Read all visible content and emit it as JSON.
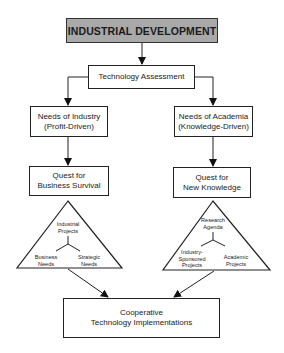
{
  "diagram": {
    "title": "INDUSTRIAL DEVELOPMENT",
    "assessment": "Technology Assessment",
    "industry": {
      "needs_line1": "Needs of Industry",
      "needs_line2": "(Profit-Driven)",
      "quest_line1": "Quest for",
      "quest_line2": "Business Survival",
      "triangle": {
        "top_line1": "Industrial",
        "top_line2": "Projects",
        "left_line1": "Business",
        "left_line2": "Needs",
        "right_line1": "Strategic",
        "right_line2": "Needs"
      }
    },
    "academia": {
      "needs_line1": "Needs of Academia",
      "needs_line2": "(Knowledge-Driven)",
      "quest_line1": "Quest for",
      "quest_line2": "New Knowledge",
      "triangle": {
        "top_line1": "Research",
        "top_line2": "Agenda",
        "left_line1": "Industry-",
        "left_line2": "Sponsored",
        "left_line3": "Projects",
        "right_line1": "Academic",
        "right_line2": "Projects"
      }
    },
    "outcome_line1": "Cooperative",
    "outcome_line2": "Technology Implementations",
    "colors": {
      "title_fill": "#a9a9a9",
      "line": "#222222",
      "background": "#ffffff"
    }
  }
}
